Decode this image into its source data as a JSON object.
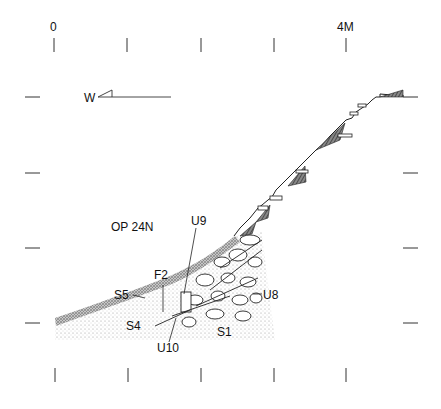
{
  "scale": {
    "start_label": "0",
    "end_label": "4M"
  },
  "orientation": {
    "label": "W"
  },
  "operation": {
    "label": "OP 24N"
  },
  "features": {
    "u9": "U9",
    "u8": "U8",
    "u10": "U10",
    "f2": "F2",
    "s1": "S1",
    "s4": "S4",
    "s5": "S5"
  },
  "colors": {
    "ink": "#111111",
    "stipple": "#bdbdbd",
    "background": "#ffffff"
  }
}
